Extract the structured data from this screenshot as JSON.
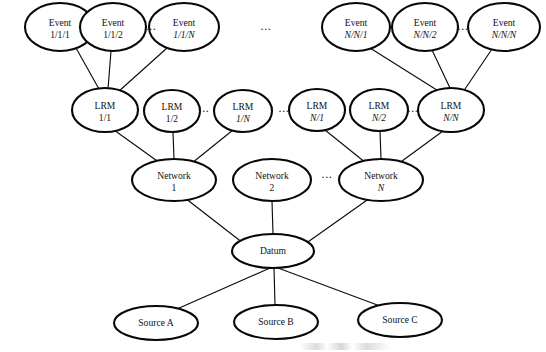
{
  "diagram": {
    "background_color": "#ffffff",
    "node_stroke_color": "#070707",
    "edge_stroke_color": "#0d0d0d",
    "text_color": "#111111",
    "ellipsis_glyph": "...",
    "levels": [
      {
        "name": "event-row",
        "label": "Event"
      },
      {
        "name": "lrm-row",
        "label": "LRM"
      },
      {
        "name": "network-row",
        "label": "Network"
      },
      {
        "name": "datum-row",
        "label": "Datum"
      },
      {
        "name": "source-row",
        "label": "Source"
      }
    ],
    "nodes": {
      "event_1_1_1": {
        "line1": "Event",
        "line2": "1/1/1",
        "cx": 60,
        "cy": 27,
        "rx": 35,
        "ry": 24
      },
      "event_1_1_2": {
        "line1": "Event",
        "line2": "1/1/2",
        "cx": 113,
        "cy": 27,
        "rx": 33,
        "ry": 24
      },
      "event_1_1_N": {
        "line1": "Event",
        "line2": "1/1/N",
        "cx": 184,
        "cy": 27,
        "rx": 35,
        "ry": 24
      },
      "event_N_N_1": {
        "line1": "Event",
        "line2": "N/N/1",
        "cx": 356,
        "cy": 27,
        "rx": 34,
        "ry": 24
      },
      "event_N_N_2": {
        "line1": "Event",
        "line2": "N/N/2",
        "cx": 425,
        "cy": 27,
        "rx": 33,
        "ry": 24
      },
      "event_N_N_N": {
        "line1": "Event",
        "line2": "N/N/N",
        "cx": 504,
        "cy": 27,
        "rx": 36,
        "ry": 24
      },
      "lrm_1_1": {
        "line1": "LRM",
        "line2": "1/1",
        "cx": 105,
        "cy": 110,
        "rx": 33,
        "ry": 22
      },
      "lrm_1_2": {
        "line1": "LRM",
        "line2": "1/2",
        "cx": 172,
        "cy": 111,
        "rx": 28,
        "ry": 21
      },
      "lrm_1_N": {
        "line1": "LRM",
        "line2": "1/N",
        "cx": 243,
        "cy": 111,
        "rx": 29,
        "ry": 21
      },
      "lrm_N_1": {
        "line1": "LRM",
        "line2": "N/1",
        "cx": 317,
        "cy": 110,
        "rx": 28,
        "ry": 21
      },
      "lrm_N_2": {
        "line1": "LRM",
        "line2": "N/2",
        "cx": 379,
        "cy": 110,
        "rx": 29,
        "ry": 21
      },
      "lrm_N_N": {
        "line1": "LRM",
        "line2": "N/N",
        "cx": 451,
        "cy": 110,
        "rx": 33,
        "ry": 22
      },
      "network_1": {
        "line1": "Network",
        "line2": "1",
        "cx": 174,
        "cy": 180,
        "rx": 42,
        "ry": 21
      },
      "network_2": {
        "line1": "Network",
        "line2": "2",
        "cx": 272,
        "cy": 180,
        "rx": 39,
        "ry": 21
      },
      "network_N": {
        "line1": "Network",
        "line2": "N",
        "cx": 381,
        "cy": 180,
        "rx": 42,
        "ry": 21
      },
      "datum": {
        "line1": "Datum",
        "line2": "",
        "cx": 273,
        "cy": 251,
        "rx": 41,
        "ry": 17
      },
      "source_a": {
        "line1": "Source A",
        "line2": "",
        "cx": 156,
        "cy": 323,
        "rx": 42,
        "ry": 17
      },
      "source_b": {
        "line1": "Source B",
        "line2": "",
        "cx": 276,
        "cy": 322,
        "rx": 42,
        "ry": 17
      },
      "source_c": {
        "line1": "Source C",
        "line2": "",
        "cx": 400,
        "cy": 320,
        "rx": 42,
        "ry": 17
      }
    },
    "ellipses": [
      {
        "name": "ellipsis-event-left",
        "x": 151,
        "y": 30
      },
      {
        "name": "ellipsis-event-middle",
        "x": 266,
        "y": 30
      },
      {
        "name": "ellipsis-event-right",
        "x": 463,
        "y": 30
      },
      {
        "name": "ellipsis-lrm-a",
        "x": 204,
        "y": 112
      },
      {
        "name": "ellipsis-lrm-b",
        "x": 284,
        "y": 112
      },
      {
        "name": "ellipsis-lrm-c",
        "x": 413,
        "y": 112
      },
      {
        "name": "ellipsis-network",
        "x": 327,
        "y": 178
      }
    ],
    "edges": [
      {
        "name": "edge-event111-lrm11",
        "from": "event_1_1_1",
        "to": "lrm_1_1",
        "x1": 76,
        "y1": 48,
        "x2": 99,
        "y2": 89
      },
      {
        "name": "edge-event112-lrm11",
        "from": "event_1_1_2",
        "to": "lrm_1_1",
        "x1": 111,
        "y1": 51,
        "x2": 108,
        "y2": 89
      },
      {
        "name": "edge-event11N-lrm11",
        "from": "event_1_1_N",
        "to": "lrm_1_1",
        "x1": 167,
        "y1": 48,
        "x2": 118,
        "y2": 92
      },
      {
        "name": "edge-eventNN1-lrmNN",
        "from": "event_N_N_1",
        "to": "lrm_N_N",
        "x1": 370,
        "y1": 48,
        "x2": 440,
        "y2": 92
      },
      {
        "name": "edge-eventNN2-lrmNN",
        "from": "event_N_N_2",
        "to": "lrm_N_N",
        "x1": 432,
        "y1": 50,
        "x2": 450,
        "y2": 88
      },
      {
        "name": "edge-eventNNN-lrmNN",
        "from": "event_N_N_N",
        "to": "lrm_N_N",
        "x1": 492,
        "y1": 49,
        "x2": 463,
        "y2": 92
      },
      {
        "name": "edge-lrm11-network1",
        "from": "lrm_1_1",
        "to": "network_1",
        "x1": 114,
        "y1": 130,
        "x2": 160,
        "y2": 163
      },
      {
        "name": "edge-lrm12-network1",
        "from": "lrm_1_2",
        "to": "network_1",
        "x1": 173,
        "y1": 132,
        "x2": 174,
        "y2": 159
      },
      {
        "name": "edge-lrm1N-network1",
        "from": "lrm_1_N",
        "to": "network_1",
        "x1": 233,
        "y1": 130,
        "x2": 192,
        "y2": 163
      },
      {
        "name": "edge-lrmN1-networkN",
        "from": "lrm_N_1",
        "to": "network_N",
        "x1": 325,
        "y1": 130,
        "x2": 366,
        "y2": 163
      },
      {
        "name": "edge-lrmN2-networkN",
        "from": "lrm_N_2",
        "to": "network_N",
        "x1": 380,
        "y1": 131,
        "x2": 381,
        "y2": 159
      },
      {
        "name": "edge-lrmNN-networkN",
        "from": "lrm_N_N",
        "to": "network_N",
        "x1": 443,
        "y1": 131,
        "x2": 398,
        "y2": 164
      },
      {
        "name": "edge-network1-datum",
        "from": "network_1",
        "to": "datum",
        "x1": 185,
        "y1": 198,
        "x2": 243,
        "y2": 243
      },
      {
        "name": "edge-network2-datum",
        "from": "network_2",
        "to": "datum",
        "x1": 272,
        "y1": 201,
        "x2": 273,
        "y2": 234
      },
      {
        "name": "edge-networkN-datum",
        "from": "network_N",
        "to": "datum",
        "x1": 370,
        "y1": 198,
        "x2": 305,
        "y2": 244
      },
      {
        "name": "edge-datum-sourcea",
        "from": "datum",
        "to": "source_a",
        "x1": 270,
        "y1": 268,
        "x2": 177,
        "y2": 309
      },
      {
        "name": "edge-datum-sourceb",
        "from": "datum",
        "to": "source_b",
        "x1": 274,
        "y1": 268,
        "x2": 275,
        "y2": 305
      },
      {
        "name": "edge-datum-sourcec",
        "from": "datum",
        "to": "source_c",
        "x1": 278,
        "y1": 268,
        "x2": 380,
        "y2": 306
      }
    ]
  }
}
